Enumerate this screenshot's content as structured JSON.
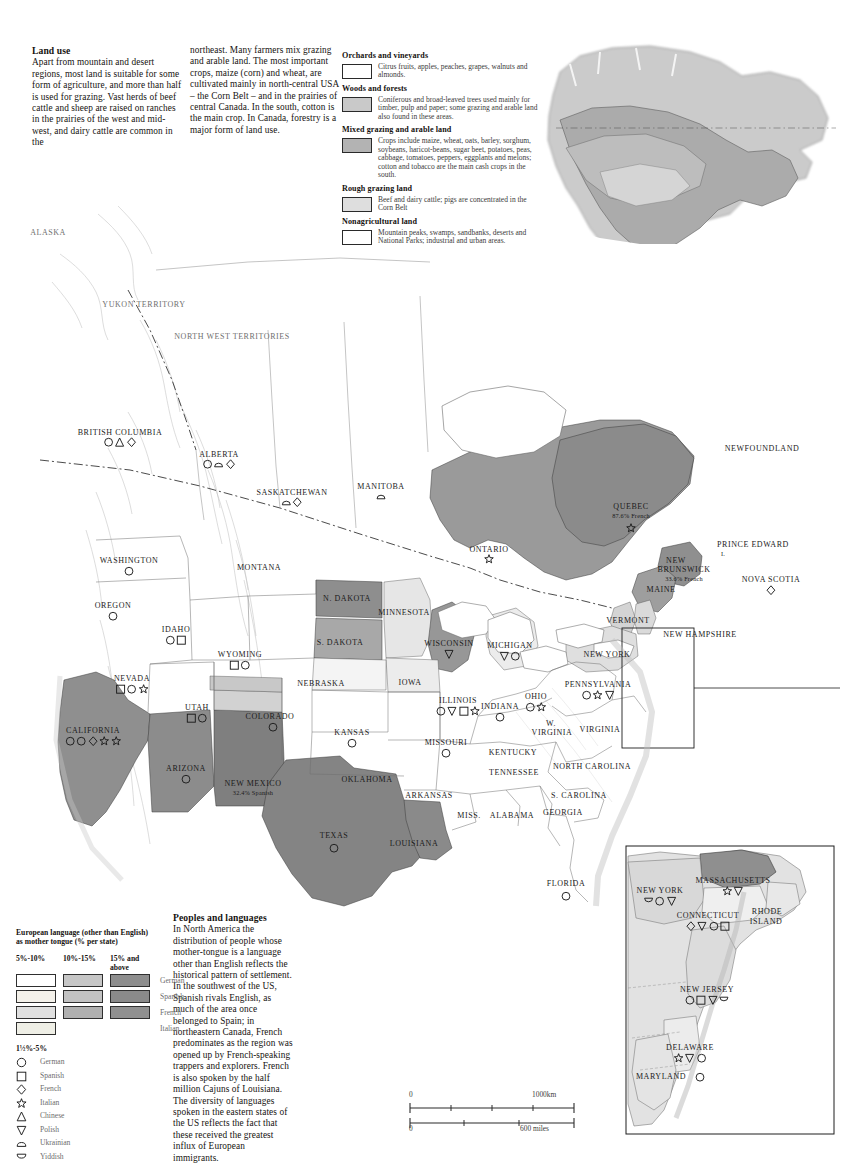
{
  "article": {
    "landuse": {
      "heading": "Land use",
      "col1": "Apart from mountain and desert regions, most land is suitable for some form of agriculture, and more than half is used for grazing. Vast herds of beef cattle and sheep are raised on ranches in the prairies of the west and mid-west, and dairy cattle are common in the",
      "col2": "northeast. Many farmers mix grazing and arable land. The most important crops, maize (corn) and wheat, are cultivated mainly in north-central USA – the Corn Belt – and in the prairies of central Canada. In the south, cotton is the main crop. In Canada, forestry is a major form of land use."
    },
    "peoples": {
      "heading": "Peoples and languages",
      "body": "In North America the distribution of people whose mother-tongue is a language other than English reflects the historical pattern of settlement. In the southwest of the US, Spanish rivals English, as much of the area once belonged to Spain; in northeastern Canada, French predominates as the region was opened up by French-speaking trappers and explorers. French is also spoken by the half million Cajuns of Louisiana. The diversity of languages spoken in the eastern states of the US reflects the fact that these received the greatest influx of European immigrants."
    }
  },
  "landuse_legend": [
    {
      "title": "Orchards and vineyards",
      "desc": "Citrus fruits, apples, peaches, grapes, walnuts and almonds.",
      "color": "#ffffff"
    },
    {
      "title": "Woods and forests",
      "desc": "Coniferous and broad-leaved trees used mainly for timber, pulp and paper; some grazing and arable land also found in these areas.",
      "color": "#c9c9c9"
    },
    {
      "title": "Mixed grazing and arable land",
      "desc": "Crops include maize, wheat, oats, barley, sorghum, soybeans, haricot-beans, sugar beet, potatoes, peas, cabbage, tomatoes, peppers, eggplants and melons; cotton and tobacco are the main cash crops in the south.",
      "color": "#b3b3b3"
    },
    {
      "title": "Rough grazing land",
      "desc": "Beef and dairy cattle; pigs are concentrated in the Corn Belt",
      "color": "#dedede"
    },
    {
      "title": "Nonagricultural land",
      "desc": "Mountain peaks, swamps, sandbanks, deserts and National Parks; industrial and urban areas.",
      "color": "#ffffff"
    }
  ],
  "language_legend": {
    "title_line1": "European language (other than English)",
    "title_line2": "as mother tongue (% per state)",
    "class_headers": [
      "5%-10%",
      "10%-15%",
      "15% and above"
    ],
    "rows": [
      {
        "language": "German",
        "c1": "#ffffff",
        "c2": "#c6c6c6",
        "c3": "#8e8e8e"
      },
      {
        "language": "Spanish",
        "c1": "#f4f1ea",
        "c2": "#c2c2c2",
        "c3": "#8a8a8a"
      },
      {
        "language": "French",
        "c1": "#e0e0e0",
        "c2": "#b0b0b0",
        "c3": "#909090"
      },
      {
        "language": "Italian",
        "c1": "#efefe6",
        "c2": "",
        "c3": ""
      }
    ],
    "symbol_header": "1½%-5%",
    "symbols": [
      {
        "shape": "circle",
        "language": "German"
      },
      {
        "shape": "square",
        "language": "Spanish"
      },
      {
        "shape": "diamond",
        "language": "French"
      },
      {
        "shape": "star",
        "language": "Italian"
      },
      {
        "shape": "triangle-up",
        "language": "Chinese"
      },
      {
        "shape": "triangle-down",
        "language": "Polish"
      },
      {
        "shape": "semi-up",
        "language": "Ukrainian"
      },
      {
        "shape": "semi-down",
        "language": "Yiddish"
      }
    ]
  },
  "scalebar": {
    "km_zero": "0",
    "km_max": "1000km",
    "mi_zero": "0",
    "mi_max": "600 miles"
  },
  "map_labels": [
    {
      "text": "ALASKA",
      "x": 48,
      "y": 232,
      "cls": "gray"
    },
    {
      "text": "YUKON TERRITORY",
      "x": 144,
      "y": 304,
      "cls": "gray"
    },
    {
      "text": "NORTH WEST TERRITORIES",
      "x": 232,
      "y": 336,
      "cls": "gray"
    },
    {
      "text": "BRITISH COLUMBIA",
      "x": 120,
      "y": 432,
      "cls": ""
    },
    {
      "text": "ALBERTA",
      "x": 219,
      "y": 454,
      "cls": ""
    },
    {
      "text": "SASKATCHEWAN",
      "x": 292,
      "y": 492,
      "cls": ""
    },
    {
      "text": "MANITOBA",
      "x": 381,
      "y": 486,
      "cls": ""
    },
    {
      "text": "NEWFOUNDLAND",
      "x": 762,
      "y": 448,
      "cls": ""
    },
    {
      "text": "ONTARIO",
      "x": 489,
      "y": 549,
      "cls": ""
    },
    {
      "text": "QUEBEC",
      "x": 631,
      "y": 506,
      "cls": ""
    },
    {
      "text": "87.6% French",
      "x": 631,
      "y": 515,
      "cls": "sm"
    },
    {
      "text": "PRINCE EDWARD",
      "x": 753,
      "y": 544,
      "cls": ""
    },
    {
      "text": "I.",
      "x": 723,
      "y": 553,
      "cls": "sm"
    },
    {
      "text": "NEW",
      "x": 676,
      "y": 560,
      "cls": ""
    },
    {
      "text": "BRUNSWICK",
      "x": 684,
      "y": 569,
      "cls": ""
    },
    {
      "text": "33.6% French",
      "x": 684,
      "y": 578,
      "cls": "sm"
    },
    {
      "text": "NOVA SCOTIA",
      "x": 771,
      "y": 579,
      "cls": ""
    },
    {
      "text": "MAINE",
      "x": 661,
      "y": 589,
      "cls": ""
    },
    {
      "text": "VERMONT",
      "x": 628,
      "y": 620,
      "cls": ""
    },
    {
      "text": "NEW HAMPSHIRE",
      "x": 700,
      "y": 634,
      "cls": ""
    },
    {
      "text": "NEW YORK",
      "x": 607,
      "y": 654,
      "cls": ""
    },
    {
      "text": "WASHINGTON",
      "x": 129,
      "y": 560,
      "cls": ""
    },
    {
      "text": "OREGON",
      "x": 113,
      "y": 605,
      "cls": ""
    },
    {
      "text": "IDAHO",
      "x": 176,
      "y": 629,
      "cls": ""
    },
    {
      "text": "MONTANA",
      "x": 259,
      "y": 567,
      "cls": ""
    },
    {
      "text": "N. DAKOTA",
      "x": 347,
      "y": 598,
      "cls": ""
    },
    {
      "text": "S. DAKOTA",
      "x": 340,
      "y": 642,
      "cls": ""
    },
    {
      "text": "MINNESOTA",
      "x": 404,
      "y": 612,
      "cls": ""
    },
    {
      "text": "WISCONSIN",
      "x": 449,
      "y": 643,
      "cls": ""
    },
    {
      "text": "MICHIGAN",
      "x": 510,
      "y": 645,
      "cls": ""
    },
    {
      "text": "WYOMING",
      "x": 240,
      "y": 654,
      "cls": ""
    },
    {
      "text": "NEVADA",
      "x": 132,
      "y": 678,
      "cls": ""
    },
    {
      "text": "UTAH",
      "x": 197,
      "y": 707,
      "cls": ""
    },
    {
      "text": "COLORADO",
      "x": 270,
      "y": 716,
      "cls": ""
    },
    {
      "text": "NEBRASKA",
      "x": 321,
      "y": 683,
      "cls": ""
    },
    {
      "text": "IOWA",
      "x": 410,
      "y": 682,
      "cls": ""
    },
    {
      "text": "ILLINOIS",
      "x": 458,
      "y": 700,
      "cls": ""
    },
    {
      "text": "INDIANA",
      "x": 500,
      "y": 706,
      "cls": ""
    },
    {
      "text": "OHIO",
      "x": 536,
      "y": 696,
      "cls": ""
    },
    {
      "text": "PENNSYLVANIA",
      "x": 598,
      "y": 684,
      "cls": ""
    },
    {
      "text": "W.",
      "x": 551,
      "y": 723,
      "cls": ""
    },
    {
      "text": "VIRGINIA",
      "x": 552,
      "y": 732,
      "cls": ""
    },
    {
      "text": "VIRGINIA",
      "x": 600,
      "y": 729,
      "cls": ""
    },
    {
      "text": "CALIFORNIA",
      "x": 93,
      "y": 730,
      "cls": ""
    },
    {
      "text": "KANSAS",
      "x": 352,
      "y": 732,
      "cls": ""
    },
    {
      "text": "MISSOURI",
      "x": 446,
      "y": 742,
      "cls": ""
    },
    {
      "text": "KENTUCKY",
      "x": 513,
      "y": 752,
      "cls": ""
    },
    {
      "text": "ARIZONA",
      "x": 186,
      "y": 768,
      "cls": ""
    },
    {
      "text": "NEW MEXICO",
      "x": 253,
      "y": 783,
      "cls": ""
    },
    {
      "text": "32.4% Spanish",
      "x": 253,
      "y": 792,
      "cls": "sm"
    },
    {
      "text": "OKLAHOMA",
      "x": 367,
      "y": 779,
      "cls": ""
    },
    {
      "text": "ARKANSAS",
      "x": 429,
      "y": 795,
      "cls": ""
    },
    {
      "text": "TENNESSEE",
      "x": 514,
      "y": 772,
      "cls": ""
    },
    {
      "text": "NORTH CAROLINA",
      "x": 592,
      "y": 766,
      "cls": ""
    },
    {
      "text": "S. CAROLINA",
      "x": 579,
      "y": 795,
      "cls": ""
    },
    {
      "text": "MISS.",
      "x": 469,
      "y": 815,
      "cls": ""
    },
    {
      "text": "ALABAMA",
      "x": 512,
      "y": 815,
      "cls": ""
    },
    {
      "text": "GEORGIA",
      "x": 563,
      "y": 812,
      "cls": ""
    },
    {
      "text": "TEXAS",
      "x": 334,
      "y": 835,
      "cls": ""
    },
    {
      "text": "LOUISIANA",
      "x": 414,
      "y": 843,
      "cls": ""
    },
    {
      "text": "FLORIDA",
      "x": 566,
      "y": 883,
      "cls": ""
    }
  ],
  "map_symbols": [
    {
      "x": 120,
      "y": 441,
      "shapes": [
        "circle",
        "triangle-up",
        "diamond"
      ]
    },
    {
      "x": 219,
      "y": 463,
      "shapes": [
        "circle",
        "semi-up",
        "diamond"
      ]
    },
    {
      "x": 292,
      "y": 501,
      "shapes": [
        "semi-up",
        "diamond"
      ]
    },
    {
      "x": 381,
      "y": 495,
      "shapes": [
        "semi-up"
      ]
    },
    {
      "x": 489,
      "y": 558,
      "shapes": [
        "star"
      ]
    },
    {
      "x": 631,
      "y": 527,
      "shapes": [
        "star"
      ]
    },
    {
      "x": 771,
      "y": 589,
      "shapes": [
        "diamond"
      ]
    },
    {
      "x": 129,
      "y": 570,
      "shapes": [
        "circle"
      ]
    },
    {
      "x": 113,
      "y": 615,
      "shapes": [
        "circle"
      ]
    },
    {
      "x": 176,
      "y": 639,
      "shapes": [
        "circle",
        "square"
      ]
    },
    {
      "x": 240,
      "y": 664,
      "shapes": [
        "square",
        "circle"
      ]
    },
    {
      "x": 132,
      "y": 688,
      "shapes": [
        "square",
        "circle",
        "star"
      ]
    },
    {
      "x": 197,
      "y": 717,
      "shapes": [
        "square",
        "circle"
      ]
    },
    {
      "x": 273,
      "y": 726,
      "shapes": [
        "circle"
      ]
    },
    {
      "x": 93,
      "y": 740,
      "shapes": [
        "circle",
        "circle",
        "diamond",
        "star",
        "star"
      ]
    },
    {
      "x": 449,
      "y": 653,
      "shapes": [
        "triangle-down"
      ]
    },
    {
      "x": 510,
      "y": 655,
      "shapes": [
        "triangle-down",
        "circle"
      ]
    },
    {
      "x": 458,
      "y": 710,
      "shapes": [
        "circle",
        "triangle-down",
        "square",
        "star"
      ]
    },
    {
      "x": 500,
      "y": 716,
      "shapes": [
        "circle"
      ]
    },
    {
      "x": 536,
      "y": 706,
      "shapes": [
        "circle",
        "star"
      ]
    },
    {
      "x": 598,
      "y": 694,
      "shapes": [
        "circle",
        "star",
        "triangle-down"
      ]
    },
    {
      "x": 352,
      "y": 742,
      "shapes": [
        "circle"
      ]
    },
    {
      "x": 446,
      "y": 752,
      "shapes": [
        "circle"
      ]
    },
    {
      "x": 186,
      "y": 778,
      "shapes": [
        "circle"
      ]
    },
    {
      "x": 334,
      "y": 847,
      "shapes": [
        "circle"
      ]
    },
    {
      "x": 566,
      "y": 895,
      "shapes": [
        "circle"
      ]
    }
  ],
  "inset_northeast": {
    "labels": [
      {
        "text": "MASSACHUSETTS",
        "x": 733,
        "y": 880
      },
      {
        "text": "NEW YORK",
        "x": 660,
        "y": 890
      },
      {
        "text": "CONNECTICUT",
        "x": 708,
        "y": 915
      },
      {
        "text": "RHODE",
        "x": 767,
        "y": 911
      },
      {
        "text": "ISLAND",
        "x": 766,
        "y": 921
      },
      {
        "text": "NEW JERSEY",
        "x": 707,
        "y": 989
      },
      {
        "text": "DELAWARE",
        "x": 690,
        "y": 1047
      },
      {
        "text": "MARYLAND",
        "x": 661,
        "y": 1076
      }
    ],
    "symbols": [
      {
        "x": 733,
        "y": 890,
        "shapes": [
          "star",
          "triangle-down"
        ]
      },
      {
        "x": 660,
        "y": 900,
        "shapes": [
          "semi-down",
          "circle",
          "triangle-down"
        ]
      },
      {
        "x": 708,
        "y": 925,
        "shapes": [
          "diamond",
          "triangle-down",
          "circle",
          "square"
        ]
      },
      {
        "x": 707,
        "y": 999,
        "shapes": [
          "circle",
          "square",
          "triangle-down",
          "semi-down"
        ]
      },
      {
        "x": 690,
        "y": 1057,
        "shapes": [
          "star",
          "triangle-down",
          "circle"
        ]
      },
      {
        "x": 700,
        "y": 1076,
        "shapes": [
          "circle"
        ]
      }
    ]
  }
}
